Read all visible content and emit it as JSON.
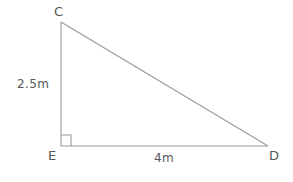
{
  "figure": {
    "type": "right-triangle-geometry-diagram",
    "stroke_color": "#9a9a9c",
    "label_color": "#58585a",
    "background_color": "#ffffff",
    "vertices": {
      "c": {
        "label": "C",
        "x": 61,
        "y": 22
      },
      "e": {
        "label": "E",
        "x": 61,
        "y": 146
      },
      "d": {
        "label": "D",
        "x": 268,
        "y": 146
      }
    },
    "sides": {
      "ce": {
        "label": "2.5m",
        "value": 2.5,
        "unit": "m"
      },
      "ed": {
        "label": "4m",
        "value": 4,
        "unit": "m"
      },
      "cd": {
        "label": "",
        "value": null,
        "unit": "m"
      }
    },
    "right_angle": {
      "at_vertex": "E",
      "marker": "square",
      "size": 10
    }
  }
}
